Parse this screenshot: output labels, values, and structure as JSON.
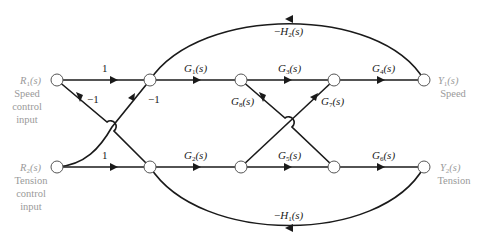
{
  "diagram": {
    "type": "signal-flow-graph",
    "colors": {
      "edge": "#1a1a1a",
      "node_stroke": "#555555",
      "io_label": "#9a9a9a"
    },
    "inputs": [
      {
        "id": "R1",
        "symbol": "R1(s)",
        "sym_main": "R",
        "sym_sub": "1",
        "sym_tail": "(s)",
        "lines": [
          "Speed",
          "control",
          "input"
        ]
      },
      {
        "id": "R2",
        "symbol": "R2(s)",
        "sym_main": "R",
        "sym_sub": "2",
        "sym_tail": "(s)",
        "lines": [
          "Tension",
          "control",
          "input"
        ]
      }
    ],
    "outputs": [
      {
        "id": "Y1",
        "symbol": "Y1(s)",
        "sym_main": "Y",
        "sym_sub": "1",
        "sym_tail": "(s)",
        "lines": [
          "Speed"
        ]
      },
      {
        "id": "Y2",
        "symbol": "Y2(s)",
        "sym_main": "Y",
        "sym_sub": "2",
        "sym_tail": "(s)",
        "lines": [
          "Tension"
        ]
      }
    ],
    "branches": {
      "r1_n1": {
        "from": "R1",
        "to": "n1",
        "gain": "1"
      },
      "r1_n4": {
        "from": "R1",
        "to": "n4",
        "gain": "−1"
      },
      "r2_n4": {
        "from": "R2",
        "to": "n4",
        "gain": "1"
      },
      "r2_n1": {
        "from": "R2",
        "to": "n1",
        "gain": "−1"
      },
      "g1": {
        "from": "n1",
        "to": "n2",
        "main": "G",
        "sub": "1",
        "tail": "(s)"
      },
      "g2": {
        "from": "n4",
        "to": "n5",
        "main": "G",
        "sub": "2",
        "tail": "(s)"
      },
      "g3": {
        "from": "n2",
        "to": "n3",
        "main": "G",
        "sub": "3",
        "tail": "(s)"
      },
      "g4": {
        "from": "n3",
        "to": "Y1",
        "main": "G",
        "sub": "4",
        "tail": "(s)"
      },
      "g5": {
        "from": "n5",
        "to": "n6",
        "main": "G",
        "sub": "5",
        "tail": "(s)"
      },
      "g6": {
        "from": "n6",
        "to": "Y2",
        "main": "G",
        "sub": "6",
        "tail": "(s)"
      },
      "g7": {
        "from": "n5",
        "to": "n3",
        "main": "G",
        "sub": "7",
        "tail": "(s)"
      },
      "g8": {
        "from": "n2",
        "to": "n6",
        "main": "G",
        "sub": "8",
        "tail": "(s)"
      },
      "h2": {
        "from": "Y1",
        "to": "n1",
        "prefix": "−",
        "main": "H",
        "sub": "2",
        "tail": "(s)"
      },
      "h1": {
        "from": "Y2",
        "to": "n4",
        "prefix": "−",
        "main": "H",
        "sub": "1",
        "tail": "(s)"
      }
    }
  }
}
